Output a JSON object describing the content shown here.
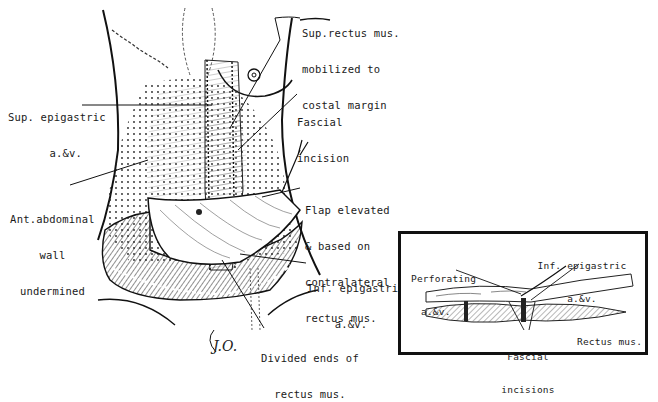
{
  "figure": {
    "type": "surgical-illustration",
    "signature": "J.O."
  },
  "labels": {
    "sup_rectus": [
      "Sup.rectus mus.",
      "mobilized to",
      "costal margin"
    ],
    "sup_epigastric": [
      "Sup. epigastric",
      "a.&v."
    ],
    "fascial_incision": [
      "Fascial",
      "incision"
    ],
    "ant_abdominal": [
      "Ant.abdominal",
      "wall",
      "undermined"
    ],
    "flap_elevated": [
      "Flap elevated",
      "& based on",
      "contralateral",
      "rectus mus."
    ],
    "inf_epigastric": [
      "Inf. epigastric",
      "a.&v."
    ],
    "divided_ends": [
      "Divided ends of",
      "rectus mus."
    ]
  },
  "inset": {
    "labels": {
      "perforating": [
        "Perforating",
        "a.&v."
      ],
      "inf_epigastric": [
        "Inf. epigastric",
        "a.&v."
      ],
      "rectus": [
        "Rectus mus."
      ],
      "fascial_incisions": [
        "Fascial",
        "incisions"
      ]
    }
  },
  "colors": {
    "ink": "#1a1a1a",
    "paper": "#ffffff"
  }
}
